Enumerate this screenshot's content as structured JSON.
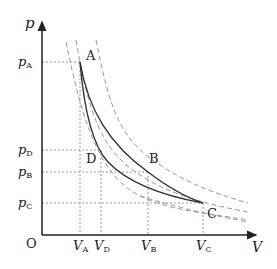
{
  "diagram": {
    "type": "p-V diagram",
    "axes": {
      "y_label": "p",
      "x_label": "V",
      "origin_label": "O"
    },
    "y_ticks": [
      {
        "main": "p",
        "sub": "A"
      },
      {
        "main": "p",
        "sub": "D"
      },
      {
        "main": "p",
        "sub": "B"
      },
      {
        "main": "p",
        "sub": "C"
      }
    ],
    "x_ticks": [
      {
        "main": "V",
        "sub": "A"
      },
      {
        "main": "V",
        "sub": "D"
      },
      {
        "main": "V",
        "sub": "B"
      },
      {
        "main": "V",
        "sub": "C"
      }
    ],
    "points": [
      {
        "label": "A"
      },
      {
        "label": "B"
      },
      {
        "label": "C"
      },
      {
        "label": "D"
      }
    ],
    "colors": {
      "curve": "#333333",
      "guide": "#888888",
      "axis": "#222222"
    }
  }
}
